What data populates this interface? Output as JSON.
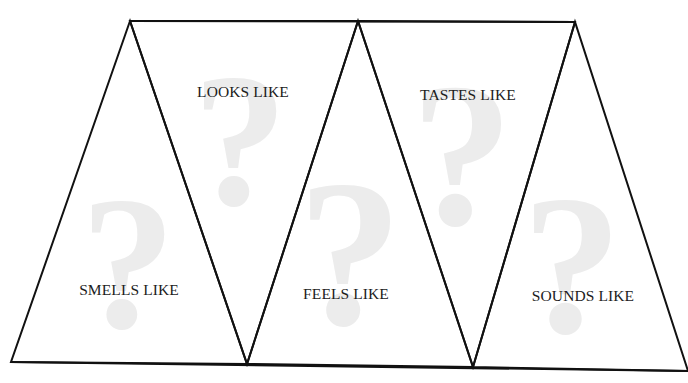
{
  "canvas": {
    "width": 688,
    "height": 383,
    "background": "#ffffff"
  },
  "style": {
    "line_color": "#111111",
    "line_width": 2,
    "watermark_color": "#ececec",
    "text_color": "#1c1c1c"
  },
  "frame": {
    "top_edge": {
      "x1": 130,
      "y1": 21,
      "x2": 575,
      "y2": 22
    },
    "bottom_edge": {
      "x1": 11,
      "y1": 362,
      "x2": 688,
      "y2": 371
    },
    "vertices_top": [
      [
        130,
        21
      ],
      [
        358,
        21
      ],
      [
        575,
        22
      ]
    ],
    "vertices_bottom": [
      [
        11,
        362
      ],
      [
        247,
        364
      ],
      [
        473,
        367
      ],
      [
        688,
        371
      ]
    ]
  },
  "panels": [
    {
      "id": "smells",
      "label": "SMELLS LIKE",
      "orientation": "up",
      "points": [
        [
          130,
          21
        ],
        [
          11,
          362
        ],
        [
          247,
          364
        ]
      ],
      "label_pos": {
        "x": 129,
        "y": 282
      },
      "watermark": {
        "glyph": "?",
        "x": 128,
        "y": 168,
        "size": 190
      }
    },
    {
      "id": "looks",
      "label": "LOOKS LIKE",
      "orientation": "down",
      "points": [
        [
          130,
          21
        ],
        [
          358,
          21
        ],
        [
          247,
          364
        ]
      ],
      "label_pos": {
        "x": 243,
        "y": 84
      },
      "watermark": {
        "glyph": "?",
        "x": 240,
        "y": 45,
        "size": 190
      }
    },
    {
      "id": "feels",
      "label": "FEELS LIKE",
      "orientation": "up",
      "points": [
        [
          358,
          21
        ],
        [
          247,
          364
        ],
        [
          473,
          367
        ]
      ],
      "label_pos": {
        "x": 346,
        "y": 286
      },
      "watermark": {
        "glyph": "?",
        "x": 350,
        "y": 148,
        "size": 210
      }
    },
    {
      "id": "tastes",
      "label": "TASTES LIKE",
      "orientation": "down",
      "points": [
        [
          358,
          21
        ],
        [
          575,
          22
        ],
        [
          473,
          367
        ]
      ],
      "label_pos": {
        "x": 468,
        "y": 87
      },
      "watermark": {
        "glyph": "?",
        "x": 462,
        "y": 52,
        "size": 205
      }
    },
    {
      "id": "sounds",
      "label": "SOUNDS LIKE",
      "orientation": "up",
      "points": [
        [
          575,
          22
        ],
        [
          473,
          367
        ],
        [
          688,
          371
        ]
      ],
      "label_pos": {
        "x": 583,
        "y": 288
      },
      "watermark": {
        "glyph": "?",
        "x": 572,
        "y": 165,
        "size": 200
      }
    }
  ]
}
